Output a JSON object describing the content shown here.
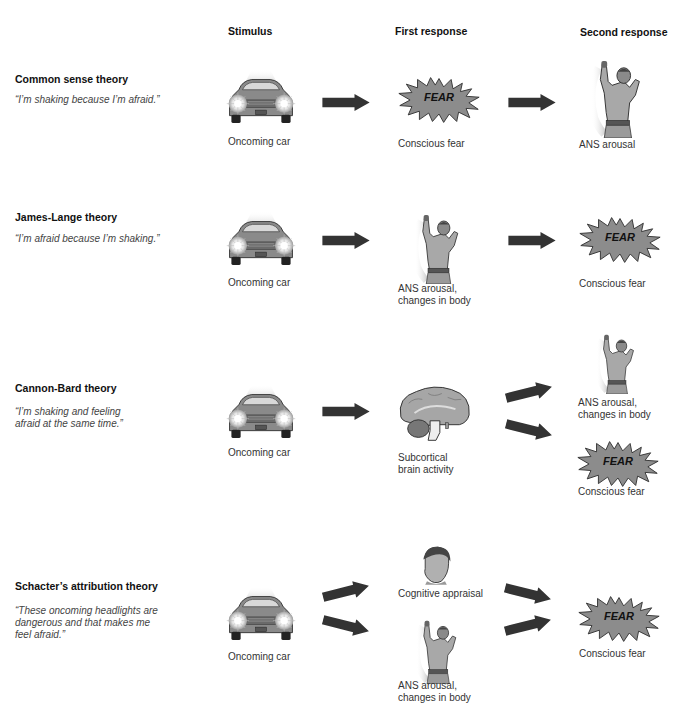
{
  "columns": {
    "stimulus": "Stimulus",
    "first_response": "First response",
    "second_response": "Second response"
  },
  "fear_label": "FEAR",
  "icons": {
    "car": "car-icon",
    "fear": "fear-burst-icon",
    "person": "shaking-person-icon",
    "brain": "brain-icon",
    "head": "thinking-head-icon",
    "arrow": "arrow-icon"
  },
  "colors": {
    "arrow": "#333333",
    "fear_fill": "#8c8c8c",
    "figure_gray": "#9a9a9a",
    "text_dark": "#111111",
    "quote_gray": "#444444"
  },
  "theories": [
    {
      "title": "Common sense theory",
      "quote": "“I’m shaking because I’m afraid.”",
      "stimulus": "Oncoming car",
      "first": [
        "Conscious fear"
      ],
      "second": [
        "ANS arousal"
      ]
    },
    {
      "title": "James-Lange theory",
      "quote": "“I’m afraid because I’m shaking.”",
      "stimulus": "Oncoming car",
      "first": [
        "ANS arousal,\nchanges in body"
      ],
      "second": [
        "Conscious fear"
      ]
    },
    {
      "title": "Cannon-Bard theory",
      "quote": "“I’m shaking and feeling afraid at the same time.”",
      "stimulus": "Oncoming car",
      "first": [
        "Subcortical\nbrain activity"
      ],
      "second": [
        "ANS arousal,\nchanges in body",
        "Conscious fear"
      ]
    },
    {
      "title": "Schacter’s attribution theory",
      "quote": "“These oncoming headlights are dangerous and that makes me feel afraid.”",
      "stimulus": "Oncoming car",
      "first": [
        "Cognitive appraisal",
        "ANS arousal,\nchanges in body"
      ],
      "second": [
        "Conscious fear"
      ]
    }
  ]
}
